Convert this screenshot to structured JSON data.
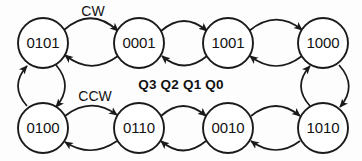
{
  "diagram": {
    "type": "state-transition-ring",
    "title_label": "Q3 Q2 Q1 Q0",
    "background_color": "#fdfdfd",
    "stroke_color": "#1a1a1a",
    "node_fill_color": "#ffffff",
    "text_color": "#111111",
    "direction_labels": [
      {
        "name": "cw",
        "text": "CW"
      },
      {
        "name": "ccw",
        "text": "CCW"
      }
    ],
    "nodes": [
      {
        "id": "n0",
        "label": "0101",
        "cx": 43,
        "cy": 43,
        "r": 25
      },
      {
        "id": "n1",
        "label": "0001",
        "cx": 139,
        "cy": 43,
        "r": 25
      },
      {
        "id": "n2",
        "label": "1001",
        "cx": 228,
        "cy": 43,
        "r": 25
      },
      {
        "id": "n3",
        "label": "1000",
        "cx": 323,
        "cy": 43,
        "r": 25
      },
      {
        "id": "n4",
        "label": "1010",
        "cx": 323,
        "cy": 128,
        "r": 25
      },
      {
        "id": "n5",
        "label": "0010",
        "cx": 228,
        "cy": 128,
        "r": 25
      },
      {
        "id": "n6",
        "label": "0110",
        "cx": 139,
        "cy": 128,
        "r": 25
      },
      {
        "id": "n7",
        "label": "0100",
        "cx": 43,
        "cy": 128,
        "r": 25
      }
    ],
    "edges": [
      {
        "from": "0101",
        "to": "0001",
        "direction": "forward"
      },
      {
        "from": "0001",
        "to": "0101",
        "direction": "reverse"
      },
      {
        "from": "0001",
        "to": "1001",
        "direction": "forward"
      },
      {
        "from": "1001",
        "to": "0001",
        "direction": "reverse"
      },
      {
        "from": "1001",
        "to": "1000",
        "direction": "forward"
      },
      {
        "from": "1000",
        "to": "1001",
        "direction": "reverse"
      },
      {
        "from": "1000",
        "to": "1010",
        "direction": "forward"
      },
      {
        "from": "1010",
        "to": "1000",
        "direction": "reverse"
      },
      {
        "from": "1010",
        "to": "0010",
        "direction": "forward"
      },
      {
        "from": "0010",
        "to": "1010",
        "direction": "reverse"
      },
      {
        "from": "0010",
        "to": "0110",
        "direction": "forward"
      },
      {
        "from": "0110",
        "to": "0010",
        "direction": "reverse"
      },
      {
        "from": "0110",
        "to": "0100",
        "direction": "forward"
      },
      {
        "from": "0100",
        "to": "0110",
        "direction": "reverse"
      },
      {
        "from": "0100",
        "to": "0101",
        "direction": "forward"
      },
      {
        "from": "0101",
        "to": "0100",
        "direction": "reverse"
      }
    ]
  }
}
